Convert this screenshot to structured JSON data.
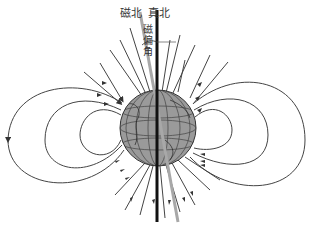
{
  "diagram": {
    "labels": {
      "magnetic_north": "磁北",
      "true_north": "真北",
      "declination": "磁偏角"
    },
    "colors": {
      "background": "#ffffff",
      "field_lines": "#333333",
      "true_north_axis": "#111111",
      "magnetic_axis": "#a8a8a8",
      "globe_fill": "#9a9a9a",
      "globe_grid": "#444444"
    },
    "field_line_loops": {
      "left": 3,
      "right": 3
    }
  }
}
